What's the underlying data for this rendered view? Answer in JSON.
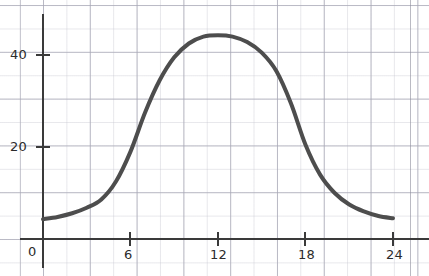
{
  "chart_data": {
    "type": "line",
    "title": "",
    "subtitle": "",
    "xlabel": "",
    "ylabel": "",
    "xlim": [
      0,
      24.5
    ],
    "ylim": [
      0,
      52
    ],
    "grid": true,
    "legend": null,
    "style": "graph-paper hand-drawn bell curve",
    "line_color": "#4d4d4d",
    "line_width": 4,
    "grid_color": "#c4c4ce",
    "axis_color": "#3a3a3a",
    "x_ticks": [
      "0",
      "6",
      "12",
      "18",
      "24"
    ],
    "x_tick_values": [
      0,
      6,
      12,
      18,
      24
    ],
    "y_ticks": [
      "20",
      "40"
    ],
    "y_tick_values": [
      20,
      40
    ],
    "series": [
      {
        "name": "curve",
        "x": [
          0,
          1,
          2,
          3,
          4,
          5,
          6,
          7,
          8,
          9,
          10,
          11,
          12,
          13,
          14,
          15,
          16,
          17,
          18,
          19,
          20,
          21,
          22,
          23,
          24
        ],
        "y": [
          4.3,
          4.8,
          5.6,
          6.8,
          8.6,
          12.5,
          19.0,
          27.5,
          34.5,
          39.5,
          42.5,
          44.0,
          44.3,
          44.0,
          42.8,
          40.5,
          36.5,
          29.5,
          20.5,
          14.0,
          10.0,
          7.5,
          6.0,
          5.0,
          4.5
        ]
      }
    ],
    "annotations": {
      "peak_x": 12,
      "peak_y": 44,
      "start_y": 4.3,
      "end_y": 4.5
    }
  },
  "axes": {
    "y_label_40": "40",
    "y_label_20": "20",
    "x_label_0": "0",
    "x_label_6": "6",
    "x_label_12": "12",
    "x_label_18": "18",
    "x_label_24": "24"
  }
}
